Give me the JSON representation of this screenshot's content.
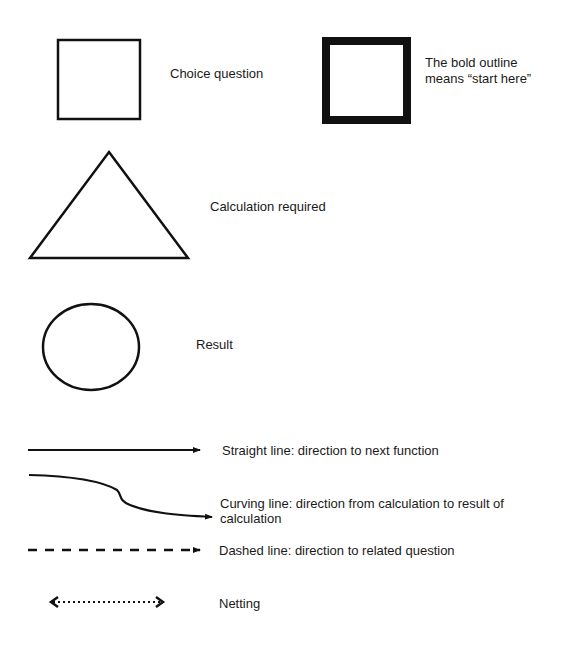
{
  "legend": {
    "items": [
      {
        "shape": "square",
        "label": "Choice question"
      },
      {
        "shape": "bold-square",
        "label_line1": "The bold outline",
        "label_line2": "means “start here”"
      },
      {
        "shape": "triangle",
        "label": "Calculation required"
      },
      {
        "shape": "circle",
        "label": "Result"
      },
      {
        "shape": "straight-arrow",
        "label": "Straight line: direction to next function"
      },
      {
        "shape": "curving-arrow",
        "label_line1": "Curving line: direction from calculation to result of",
        "label_line2": "calculation"
      },
      {
        "shape": "dashed-arrow",
        "label": "Dashed line: direction to related question"
      },
      {
        "shape": "dotted-double-arrow",
        "label": "Netting"
      }
    ]
  },
  "colors": {
    "stroke": "#111111",
    "background": "#ffffff",
    "text": "#1a1a1a"
  }
}
